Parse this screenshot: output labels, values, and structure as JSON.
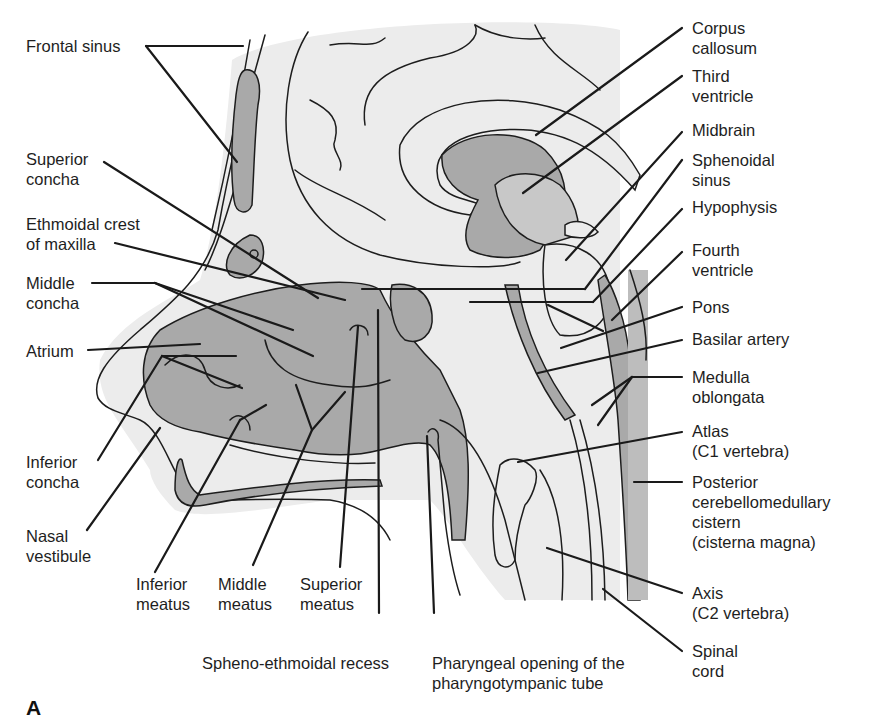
{
  "figure": {
    "panel_letter": "A",
    "colors": {
      "background": "#ffffff",
      "cavity_fill": "#a9a9a9",
      "tissue_fill": "#ececec",
      "line": "#1a1a1a"
    },
    "labels_left": [
      {
        "id": "frontal-sinus",
        "lines": [
          "Frontal sinus"
        ]
      },
      {
        "id": "superior-concha",
        "lines": [
          "Superior",
          "concha"
        ]
      },
      {
        "id": "ethmoidal-crest",
        "lines": [
          "Ethmoidal crest",
          "of maxilla"
        ]
      },
      {
        "id": "middle-concha",
        "lines": [
          "Middle",
          "concha"
        ]
      },
      {
        "id": "atrium",
        "lines": [
          "Atrium"
        ]
      },
      {
        "id": "inferior-concha",
        "lines": [
          "Inferior",
          "concha"
        ]
      },
      {
        "id": "nasal-vestibule",
        "lines": [
          "Nasal",
          "vestibule"
        ]
      }
    ],
    "labels_bottom": [
      {
        "id": "inferior-meatus",
        "lines": [
          "Inferior",
          "meatus"
        ]
      },
      {
        "id": "middle-meatus",
        "lines": [
          "Middle",
          "meatus"
        ]
      },
      {
        "id": "superior-meatus",
        "lines": [
          "Superior",
          "meatus"
        ]
      },
      {
        "id": "spheno-ethmoidal-recess",
        "lines": [
          "Spheno-ethmoidal recess"
        ]
      },
      {
        "id": "pharyngeal-opening",
        "lines": [
          "Pharyngeal opening of the",
          "pharyngotympanic tube"
        ]
      }
    ],
    "labels_right": [
      {
        "id": "corpus-callosum",
        "lines": [
          "Corpus",
          "callosum"
        ]
      },
      {
        "id": "third-ventricle",
        "lines": [
          "Third",
          "ventricle"
        ]
      },
      {
        "id": "midbrain",
        "lines": [
          "Midbrain"
        ]
      },
      {
        "id": "sphenoidal-sinus",
        "lines": [
          "Sphenoidal",
          "sinus"
        ]
      },
      {
        "id": "hypophysis",
        "lines": [
          "Hypophysis"
        ]
      },
      {
        "id": "fourth-ventricle",
        "lines": [
          "Fourth",
          "ventricle"
        ]
      },
      {
        "id": "pons",
        "lines": [
          "Pons"
        ]
      },
      {
        "id": "basilar-artery",
        "lines": [
          "Basilar artery"
        ]
      },
      {
        "id": "medulla-oblongata",
        "lines": [
          "Medulla",
          "oblongata"
        ]
      },
      {
        "id": "atlas",
        "lines": [
          "Atlas",
          "(C1 vertebra)"
        ]
      },
      {
        "id": "posterior-cistern",
        "lines": [
          "Posterior",
          "cerebellomedullary",
          "cistern",
          "(cisterna magna)"
        ]
      },
      {
        "id": "axis",
        "lines": [
          "Axis",
          "(C2 vertebra)"
        ]
      },
      {
        "id": "spinal-cord",
        "lines": [
          "Spinal",
          "cord"
        ]
      }
    ]
  }
}
